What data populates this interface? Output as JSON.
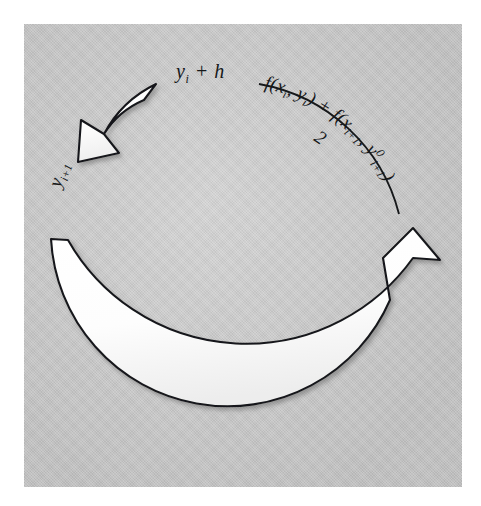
{
  "figure": {
    "kind": "predictor-corrector-cycle-diagram",
    "background_color": "#ffffff",
    "panel_color": "#c9c9c9",
    "ink_color": "#16181a",
    "arrow_fill": "#ffffff",
    "arrow_stroke": "#16181a"
  },
  "labels": {
    "top_left": {
      "id": "y-i-plus-h",
      "base": "y",
      "sub": "i",
      "tail": " + h",
      "plain": "y_i + h"
    },
    "left_rotated": {
      "id": "y-i-plus-1",
      "base": "y",
      "sub": "i+1",
      "plain": "y_{i+1}",
      "rotation_deg": -72
    }
  },
  "formula": {
    "plain": "[ f(x_i, y_i) + f(x_{i+1}, y^0_{i+1}) ] / 2",
    "numerator": {
      "segments": [
        {
          "text": "f(x",
          "style": "italic"
        },
        {
          "text": "i",
          "style": "sub"
        },
        {
          "text": ", y",
          "style": "italic"
        },
        {
          "text": "i",
          "style": "sub"
        },
        {
          "text": ") + f(x",
          "style": "italic"
        },
        {
          "text": "i+1",
          "style": "sub"
        },
        {
          "text": ", y",
          "style": "italic"
        },
        {
          "text": "0",
          "style": "sup"
        },
        {
          "text": "i+1",
          "style": "sub"
        },
        {
          "text": ")",
          "style": "italic"
        }
      ],
      "flat": "f(xi, yi) + f(xi+1, y0i+1)"
    },
    "denominator": "2",
    "fraction_bar": "curved-along-arc"
  },
  "arrows": {
    "main": {
      "id": "main-cycle-arrow",
      "description": "large white block arrow sweeping clockwise from upper-left tail, around the bottom, up the right side",
      "direction": "clockwise",
      "head": "up",
      "tail_at": "upper-left",
      "head_at": "right"
    },
    "return": {
      "id": "return-arrow",
      "description": "short curved white block arrow at top pointing down and to the left",
      "direction": "counter-clockwise",
      "head": "down-left",
      "tail_at": "top-center",
      "head_at": "upper-left"
    }
  }
}
